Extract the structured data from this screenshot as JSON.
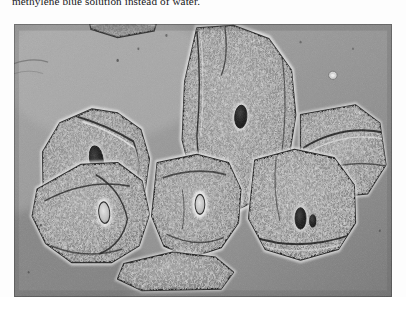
{
  "page": {
    "background_color": "#ffffff",
    "caption_text": "methylene blue solution instead of water.",
    "caption_clipped": true
  },
  "micrograph": {
    "alt_label": "phase-contrast micrograph of human cheek squamous epithelial cells",
    "frame": {
      "x": 14,
      "y": 24,
      "width": 378,
      "height": 273
    },
    "background_color": "#8f8f8f",
    "tone": {
      "field_light": "#b9b9b9",
      "field_mid": "#9a9a9a",
      "field_dark": "#6d6d6d",
      "cytoplasm": "#8a8a8a",
      "membrane_dark": "#2a2a2a",
      "halo_light": "#e2e2e2",
      "nucleus_dark": "#161616",
      "nucleus_light": "#cfcfcf"
    },
    "cells": [
      {
        "id": "cell-upper-left",
        "label": "upper left squamous cell",
        "outline": "75,120 128,103 170,108 208,128 222,163 214,205 186,246 150,262 110,258 72,236 48,198 47,155",
        "nucleus": {
          "cx": 135,
          "cy": 163,
          "rx": 11,
          "ry": 16,
          "rotate": -18,
          "shade": "dark"
        }
      },
      {
        "id": "cell-upper-right",
        "label": "upper right squamous cell",
        "outline": "300,5 360,2 418,18 455,56 462,110 450,165 418,205 372,222 325,215 292,186 276,140 280,70",
        "nucleus": {
          "cx": 372,
          "cy": 112,
          "rx": 10,
          "ry": 14,
          "rotate": 8,
          "shade": "dark"
        }
      },
      {
        "id": "cell-right-edge",
        "label": "right edge folded cell",
        "outline": "470,110 560,98 600,120 610,170 580,205 510,210 470,180",
        "nucleus": null
      },
      {
        "id": "cell-lower-left",
        "label": "lower left elongated cell",
        "outline": "38,200 110,170 170,168 210,190 222,230 205,268 160,288 95,288 52,265 30,232",
        "nucleus": {
          "cx": 148,
          "cy": 228,
          "rx": 9,
          "ry": 13,
          "rotate": -10,
          "shade": "light"
        }
      },
      {
        "id": "cell-lower-middle",
        "label": "lower middle squamous cell",
        "outline": "235,168 300,158 352,168 372,200 368,240 340,270 290,282 246,268 226,232",
        "nucleus": {
          "cx": 305,
          "cy": 218,
          "rx": 8,
          "ry": 12,
          "rotate": 0,
          "shade": "light"
        }
      },
      {
        "id": "cell-lower-right",
        "label": "lower right squamous cell",
        "outline": "395,165 460,152 525,162 558,195 560,240 532,272 470,285 412,272 385,235",
        "nucleus": {
          "cx": 470,
          "cy": 235,
          "rx": 9,
          "ry": 13,
          "rotate": 0,
          "shade": "dark"
        },
        "nucleolus": {
          "cx": 490,
          "cy": 238,
          "rx": 6,
          "ry": 8
        }
      },
      {
        "id": "cell-bottom-partial",
        "label": "bottom partial cell",
        "outline": "180,290 260,276 330,282 360,300 340,320 210,322 170,308",
        "nucleus": null
      },
      {
        "id": "cell-top-partial",
        "label": "top partial cell",
        "outline": "120,-20 200,-24 236,-8 230,8 170,16 126,6",
        "nucleus": null
      }
    ],
    "debris": [
      {
        "cx": 523,
        "cy": 62,
        "rx": 7,
        "ry": 5,
        "shade": "light"
      },
      {
        "cx": 170,
        "cy": 44,
        "r": 2.0
      },
      {
        "cx": 204,
        "cy": 30,
        "r": 1.6
      },
      {
        "cx": 250,
        "cy": 14,
        "r": 1.8
      },
      {
        "cx": 470,
        "cy": 22,
        "r": 1.7
      },
      {
        "cx": 556,
        "cy": 30,
        "r": 1.5
      },
      {
        "cx": 44,
        "cy": 243,
        "r": 1.9
      },
      {
        "cx": 24,
        "cy": 300,
        "r": 1.5
      },
      {
        "cx": 600,
        "cy": 250,
        "r": 1.6
      }
    ]
  }
}
